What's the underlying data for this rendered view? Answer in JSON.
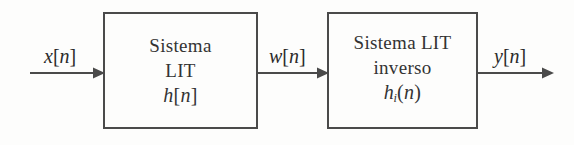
{
  "figure": {
    "name": "bloque-sistema-lit-inverso",
    "background_color": "#fdfdfc",
    "line_color": "#4a4a4a",
    "text_color": "#2b2b2b",
    "width": 574,
    "height": 145
  },
  "blocks": [
    {
      "id": "lit",
      "line1": "Sistema",
      "line2": "LIT",
      "impulse_response": {
        "symbol": "h",
        "subscript": "",
        "open": "[",
        "arg": "n",
        "close": "]"
      }
    },
    {
      "id": "inverse",
      "line1": "Sistema LIT",
      "line2": "inverso",
      "impulse_response": {
        "symbol": "h",
        "subscript": "i",
        "open": "(",
        "arg": "n",
        "close": ")"
      }
    }
  ],
  "signals": [
    {
      "id": "input",
      "symbol": "x",
      "open": "[",
      "arg": "n",
      "close": "]",
      "label": "x[n]"
    },
    {
      "id": "middle",
      "symbol": "w",
      "open": "[",
      "arg": "n",
      "close": "]",
      "label": "w[n]"
    },
    {
      "id": "output",
      "symbol": "y",
      "open": "[",
      "arg": "n",
      "close": "]",
      "label": "y[n]"
    }
  ],
  "arrows": [
    {
      "id": "arrow-input",
      "direction": "right"
    },
    {
      "id": "arrow-middle",
      "direction": "right"
    },
    {
      "id": "arrow-output",
      "direction": "right"
    }
  ]
}
